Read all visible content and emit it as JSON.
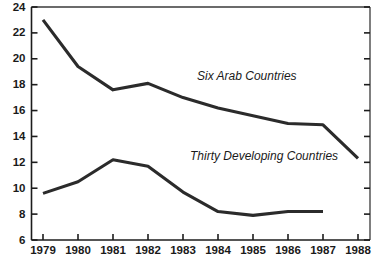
{
  "chart_data": {
    "type": "line",
    "title": "",
    "subtitle": "",
    "xlabel": "",
    "ylabel": "",
    "x": [
      1979,
      1980,
      1981,
      1982,
      1983,
      1984,
      1985,
      1986,
      1987,
      1988
    ],
    "categories": [
      "1979",
      "1980",
      "1981",
      "1982",
      "1983",
      "1984",
      "1985",
      "1986",
      "1987",
      "1988"
    ],
    "xlim": [
      1979,
      1988
    ],
    "ylim": [
      6,
      24
    ],
    "ytick_values": [
      6,
      8,
      10,
      12,
      14,
      16,
      18,
      20,
      22,
      24
    ],
    "ytick_labels": [
      "6",
      "8",
      "10",
      "12",
      "14",
      "16",
      "18",
      "20",
      "22",
      "24"
    ],
    "xtick_labels": [
      "1979",
      "1980",
      "1981",
      "1982",
      "1983",
      "1984",
      "1985",
      "1986",
      "1987",
      "1988"
    ],
    "grid": false,
    "legend_position": "inline-annotation",
    "line_color": "#2b2b2b",
    "axis_color": "#1c1c1c",
    "background_color": "#ffffff",
    "series": [
      {
        "name": "Six Arab Countries",
        "label": "Six Arab Countries",
        "x": [
          1979,
          1980,
          1981,
          1982,
          1983,
          1984,
          1985,
          1986,
          1987,
          1988
        ],
        "values": [
          23.0,
          19.4,
          17.6,
          18.1,
          17.0,
          16.2,
          15.6,
          15.0,
          14.9,
          12.3
        ],
        "color": "#2b2b2b",
        "annotation_x": 1983.4,
        "annotation_y": 18.6
      },
      {
        "name": "Thirty Developing Countries",
        "label": "Thirty Developing Countries",
        "x": [
          1979,
          1980,
          1981,
          1982,
          1983,
          1984,
          1985,
          1986,
          1987
        ],
        "values": [
          9.6,
          10.5,
          12.2,
          11.7,
          9.7,
          8.2,
          7.9,
          8.2,
          8.2
        ],
        "color": "#2b2b2b",
        "annotation_x": 1983.2,
        "annotation_y": 12.4
      }
    ]
  }
}
